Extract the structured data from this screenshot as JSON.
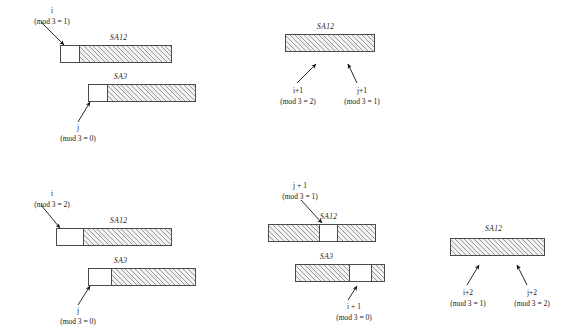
{
  "figure": {
    "ink_color": "#4a4a4a",
    "hatch_color": "#9a9a9a",
    "background": "#ffffff"
  },
  "panels": [
    {
      "id": "top-left",
      "bars": [
        {
          "name": "SA12",
          "cells": [
            {
              "fill": "white"
            },
            {
              "fill": "hatch"
            }
          ]
        },
        {
          "name": "SA3",
          "cells": [
            {
              "fill": "white"
            },
            {
              "fill": "hatch"
            }
          ]
        }
      ],
      "annotations": [
        {
          "id": "i-top-left",
          "top": "i",
          "bottom": "(mod 3 = 1)"
        },
        {
          "id": "j-top-left",
          "top": "j",
          "bottom": "(mod 3 = 0)"
        }
      ]
    },
    {
      "id": "top-right",
      "bars": [
        {
          "name": "SA12",
          "cells": [
            {
              "fill": "hatch"
            }
          ]
        }
      ],
      "annotations": [
        {
          "id": "i1-top-right",
          "top": "i+1",
          "bottom": "(mod 3 = 2)"
        },
        {
          "id": "j1-top-right",
          "top": "j+1",
          "bottom": "(mod 3 = 1)"
        }
      ]
    },
    {
      "id": "bottom-left",
      "bars": [
        {
          "name": "SA12",
          "cells": [
            {
              "fill": "white"
            },
            {
              "fill": "hatch"
            }
          ]
        },
        {
          "name": "SA3",
          "cells": [
            {
              "fill": "white"
            },
            {
              "fill": "hatch"
            }
          ]
        }
      ],
      "annotations": [
        {
          "id": "i-bottom-left",
          "top": "i",
          "bottom": "(mod 3 = 2)"
        },
        {
          "id": "j-bottom-left",
          "top": "j",
          "bottom": "(mod 3 = 0)"
        }
      ]
    },
    {
      "id": "bottom-middle",
      "bars": [
        {
          "name": "SA12",
          "cells": [
            {
              "fill": "hatch"
            },
            {
              "fill": "white"
            },
            {
              "fill": "hatch"
            }
          ]
        },
        {
          "name": "SA3",
          "cells": [
            {
              "fill": "hatch"
            },
            {
              "fill": "white"
            },
            {
              "fill": "hatch"
            }
          ]
        }
      ],
      "annotations": [
        {
          "id": "j1-bottom-middle",
          "top": "j + 1",
          "bottom": "(mod 3 = 1)"
        },
        {
          "id": "i1-bottom-middle",
          "top": "i + 1",
          "bottom": "(mod 3 = 0)"
        }
      ]
    },
    {
      "id": "bottom-right",
      "bars": [
        {
          "name": "SA12",
          "cells": [
            {
              "fill": "hatch"
            }
          ]
        }
      ],
      "annotations": [
        {
          "id": "i2-bottom-right",
          "top": "i+2",
          "bottom": "(mod 3 = 1)"
        },
        {
          "id": "j2-bottom-right",
          "top": "j+2",
          "bottom": "(mod 3 = 2)"
        }
      ]
    }
  ],
  "labels": {
    "tl_i_top": "i",
    "tl_i_bot": "(mod 3 = 1)",
    "tl_sa12": "SA12",
    "tl_sa3": "SA3",
    "tl_j_top": "j",
    "tl_j_bot": "(mod 3 = 0)",
    "tr_sa12": "SA12",
    "tr_i1_top": "i+1",
    "tr_i1_bot": "(mod 3 = 2)",
    "tr_j1_top": "j+1",
    "tr_j1_bot": "(mod 3 = 1)",
    "bl_i_top": "i",
    "bl_i_bot": "(mod 3 = 2)",
    "bl_sa12": "SA12",
    "bl_sa3": "SA3",
    "bl_j_top": "j",
    "bl_j_bot": "(mod 3 = 0)",
    "bm_j1_top": "j + 1",
    "bm_j1_bot": "(mod 3 = 1)",
    "bm_sa12": "SA12",
    "bm_sa3": "SA3",
    "bm_i1_top": "i + 1",
    "bm_i1_bot": "(mod 3 = 0)",
    "br_sa12": "SA12",
    "br_i2_top": "i+2",
    "br_i2_bot": "(mod 3 = 1)",
    "br_j2_top": "j+2",
    "br_j2_bot": "(mod 3 = 2)"
  }
}
